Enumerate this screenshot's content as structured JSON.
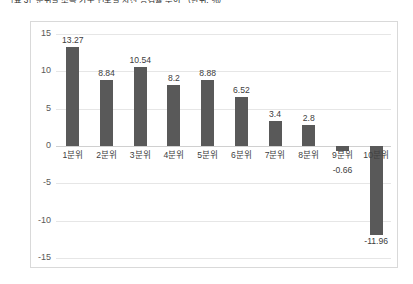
{
  "caption": "［표 3］분위별 소득 가구 연도별 자산 증감률 추이 （단위: ％）",
  "chart_data": {
    "type": "bar",
    "title": "",
    "xlabel": "",
    "ylabel": "",
    "categories": [
      "1분위",
      "2분위",
      "3분위",
      "4분위",
      "5분위",
      "6분위",
      "7분위",
      "8분위",
      "9분위",
      "10분위"
    ],
    "values": [
      13.27,
      8.84,
      10.54,
      8.2,
      8.88,
      6.52,
      3.4,
      2.8,
      -0.66,
      -11.96
    ],
    "value_labels": [
      "13.27",
      "8.84",
      "10.54",
      "8.2",
      "8.88",
      "6.52",
      "3.4",
      "2.8",
      "-0.66",
      "-11.96"
    ],
    "yticks": [
      15,
      10,
      5,
      0,
      -5,
      -10,
      -15
    ],
    "ytick_labels": [
      "15",
      "10",
      "5",
      "0",
      "-5",
      "-10",
      "-15"
    ],
    "ylim": [
      -15,
      15
    ],
    "grid": true,
    "legend": "none",
    "bar_color": "#595959",
    "grid_color": "#e6e6e6",
    "border_color": "#d9d9d9"
  }
}
